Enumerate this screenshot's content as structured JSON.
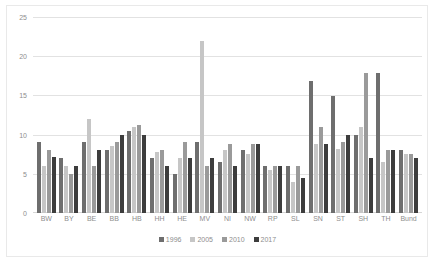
{
  "chart_data": {
    "type": "bar",
    "title": "",
    "subtitle": "",
    "xlabel": "",
    "ylabel": "",
    "ylim": [
      0,
      25
    ],
    "yticks": [
      0,
      5,
      10,
      15,
      20,
      25
    ],
    "grid": true,
    "legend_position": "bottom",
    "categories": [
      "BW",
      "BY",
      "BE",
      "BB",
      "HB",
      "HH",
      "HE",
      "MV",
      "NI",
      "NW",
      "RP",
      "SL",
      "SN",
      "ST",
      "SH",
      "TH",
      "Bund"
    ],
    "series": [
      {
        "name": "1996",
        "color": "#6e6e6e",
        "values": [
          9.0,
          7.0,
          9.0,
          8.0,
          10.5,
          7.0,
          5.0,
          9.0,
          6.5,
          8.0,
          6.0,
          6.0,
          16.8,
          14.9,
          10.0,
          17.8,
          8.0
        ]
      },
      {
        "name": "2005",
        "color": "#c6c6c6",
        "values": [
          6.0,
          6.0,
          12.0,
          8.5,
          11.0,
          7.8,
          7.0,
          22.0,
          8.0,
          7.5,
          5.5,
          4.0,
          8.8,
          8.2,
          11.0,
          6.5,
          7.5
        ]
      },
      {
        "name": "2010",
        "color": "#9a9a9a",
        "values": [
          8.0,
          5.0,
          6.0,
          9.0,
          11.2,
          8.0,
          9.0,
          6.0,
          8.8,
          8.8,
          6.0,
          6.0,
          11.0,
          9.0,
          17.8,
          8.0,
          7.5
        ]
      },
      {
        "name": "2017",
        "color": "#3d3d3d",
        "values": [
          7.2,
          6.0,
          8.0,
          10.0,
          10.0,
          6.0,
          7.0,
          7.0,
          6.0,
          8.8,
          6.0,
          4.5,
          8.8,
          10.0,
          7.0,
          8.0,
          7.0
        ]
      }
    ]
  },
  "axis": {
    "y_tick_labels": [
      "0",
      "5",
      "10",
      "15",
      "20",
      "25"
    ]
  },
  "legend": {
    "items": [
      {
        "label": "1996",
        "color": "#6e6e6e"
      },
      {
        "label": "2005",
        "color": "#c6c6c6"
      },
      {
        "label": "2010",
        "color": "#9a9a9a"
      },
      {
        "label": "2017",
        "color": "#3d3d3d"
      }
    ]
  }
}
